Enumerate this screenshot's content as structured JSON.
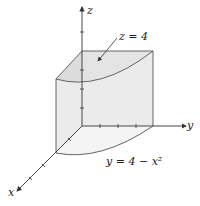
{
  "figure": {
    "type": "3d-region-diagram",
    "axes": {
      "x": "x",
      "y": "y",
      "z": "z"
    },
    "annotations": {
      "top_surface": "z = 4",
      "base_curve": "y = 4 − x²"
    },
    "colors": {
      "fill": "#e4e4e4",
      "stroke": "#555555"
    }
  }
}
